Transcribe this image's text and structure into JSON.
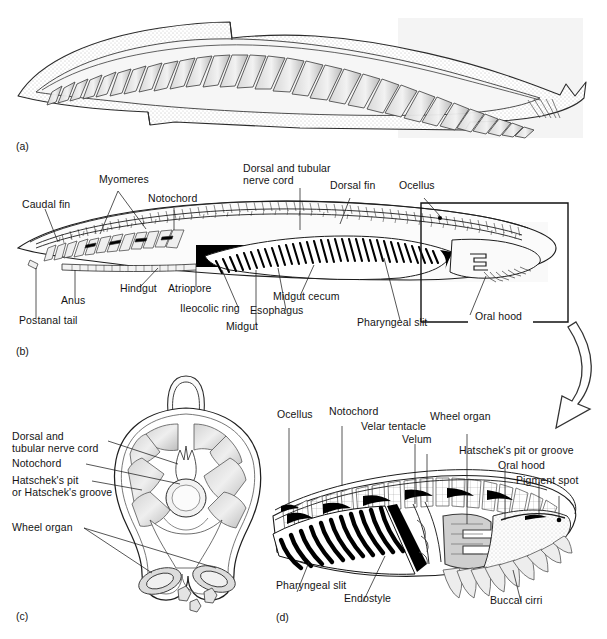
{
  "figure": {
    "panels": [
      {
        "id": "(a)",
        "name": "external-lateral-view"
      },
      {
        "id": "(b)",
        "name": "sagittal-internal-anatomy"
      },
      {
        "id": "(c)",
        "name": "cross-section-through-pharynx"
      },
      {
        "id": "(d)",
        "name": "enlarged-anterior-end"
      }
    ]
  },
  "panel_a": {
    "id": "(a)"
  },
  "panel_b": {
    "id": "(b)",
    "labels": [
      {
        "name": "caudal-fin",
        "text": "Caudal fin",
        "x": 22,
        "y": 205
      },
      {
        "name": "myomeres",
        "text": "Myomeres",
        "x": 99,
        "y": 180
      },
      {
        "name": "notochord",
        "text": "Notochord",
        "x": 148,
        "y": 199
      },
      {
        "name": "dorsal-tubular-nerve-cord-line1",
        "text": "Dorsal and tubular",
        "x": 244,
        "y": 169
      },
      {
        "name": "dorsal-tubular-nerve-cord-line2",
        "text": "nerve cord",
        "x": 244,
        "y": 181
      },
      {
        "name": "dorsal-fin",
        "text": "Dorsal fin",
        "x": 330,
        "y": 186
      },
      {
        "name": "ocellus",
        "text": "Ocellus",
        "x": 400,
        "y": 186
      },
      {
        "name": "postanal-tail",
        "text": "Postanal tail",
        "x": 19,
        "y": 320
      },
      {
        "name": "anus",
        "text": "Anus",
        "x": 65,
        "y": 300
      },
      {
        "name": "hindgut",
        "text": "Hindgut",
        "x": 121,
        "y": 288
      },
      {
        "name": "atriopore",
        "text": "Atriopore",
        "x": 167,
        "y": 288
      },
      {
        "name": "ileocolic-ring",
        "text": "Ileocolic ring",
        "x": 181,
        "y": 308
      },
      {
        "name": "midgut",
        "text": "Midgut",
        "x": 231,
        "y": 327
      },
      {
        "name": "esophagus",
        "text": "Esophagus",
        "x": 255,
        "y": 311
      },
      {
        "name": "midgut-cecum",
        "text": "Midgut cecum",
        "x": 277,
        "y": 297
      },
      {
        "name": "pharyngeal-slit",
        "text": "Pharyngeal slit",
        "x": 358,
        "y": 323
      },
      {
        "name": "oral-hood",
        "text": "Oral hood",
        "x": 477,
        "y": 317
      }
    ]
  },
  "panel_c": {
    "id": "(c)",
    "labels": [
      {
        "name": "dorsal-tubular-nerve-cord-line1",
        "text": "Dorsal and",
        "x": 12,
        "y": 432
      },
      {
        "name": "dorsal-tubular-nerve-cord-line2",
        "text": "tubular nerve cord",
        "x": 12,
        "y": 444
      },
      {
        "name": "notochord",
        "text": "Notochord",
        "x": 12,
        "y": 459
      },
      {
        "name": "hatscheks-pit-line1",
        "text": "Hatschek's pit",
        "x": 12,
        "y": 476
      },
      {
        "name": "hatscheks-pit-line2",
        "text": "or Hatschek's groove",
        "x": 12,
        "y": 488
      },
      {
        "name": "wheel-organ",
        "text": "Wheel organ",
        "x": 12,
        "y": 524
      }
    ]
  },
  "panel_d": {
    "id": "(d)",
    "labels": [
      {
        "name": "ocellus",
        "text": "Ocellus",
        "x": 283,
        "y": 415
      },
      {
        "name": "notochord",
        "text": "Notochord",
        "x": 334,
        "y": 412
      },
      {
        "name": "velar-tentacle",
        "text": "Velar tentacle",
        "x": 366,
        "y": 427
      },
      {
        "name": "velum",
        "text": "Velum",
        "x": 406,
        "y": 440
      },
      {
        "name": "wheel-organ",
        "text": "Wheel organ",
        "x": 433,
        "y": 417
      },
      {
        "name": "hatscheks-pit-or-groove",
        "text": "Hatschek's pit or groove",
        "x": 465,
        "y": 451
      },
      {
        "name": "oral-hood",
        "text": "Oral hood",
        "x": 502,
        "y": 466
      },
      {
        "name": "pigment-spot",
        "text": "Pigment spot",
        "x": 520,
        "y": 481
      },
      {
        "name": "pharyngeal-slit",
        "text": "Pharyngeal slit",
        "x": 281,
        "y": 585
      },
      {
        "name": "endostyle",
        "text": "Endostyle",
        "x": 348,
        "y": 598
      },
      {
        "name": "buccal-cirri",
        "text": "Buccal cirri",
        "x": 494,
        "y": 600
      }
    ]
  },
  "callout": {
    "name": "detail-box-and-arrow",
    "box": {
      "x": 421,
      "y": 203,
      "w": 147,
      "h": 119
    },
    "arrow_label": "curved-arrow-to-panel-d"
  },
  "colors": {
    "ink": "#141414",
    "line": "#222222",
    "fill_light": "#e9e9e9",
    "fill_mid": "#c9c9c9",
    "fill_dark": "#8e8e8e",
    "black": "#000000",
    "scan_tint": "#f4f4f4",
    "paper": "#ffffff"
  }
}
